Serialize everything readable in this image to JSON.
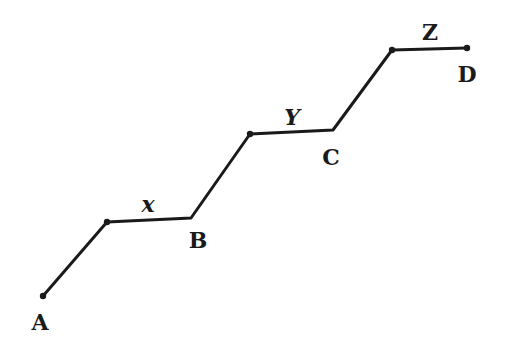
{
  "diagram": {
    "stroke_color": "#1a1a1a",
    "background": "#ffffff",
    "path_points": [
      [
        43,
        296
      ],
      [
        107,
        222
      ],
      [
        191,
        218
      ],
      [
        250,
        134
      ],
      [
        333,
        130
      ],
      [
        392,
        50
      ],
      [
        467,
        48
      ]
    ],
    "dots": [
      [
        43,
        296
      ],
      [
        107,
        222
      ],
      [
        250,
        134
      ],
      [
        392,
        50
      ],
      [
        467,
        48
      ]
    ],
    "labels": {
      "A": {
        "text": "A",
        "x": 40,
        "y": 322
      },
      "B": {
        "text": "B",
        "x": 198,
        "y": 240
      },
      "C": {
        "text": "C",
        "x": 331,
        "y": 157
      },
      "D": {
        "text": "D",
        "x": 467,
        "y": 74
      },
      "x": {
        "text": "x",
        "x": 148,
        "y": 204
      },
      "Y": {
        "text": "Y",
        "x": 292,
        "y": 117
      },
      "Z": {
        "text": "Z",
        "x": 430,
        "y": 32
      }
    }
  }
}
